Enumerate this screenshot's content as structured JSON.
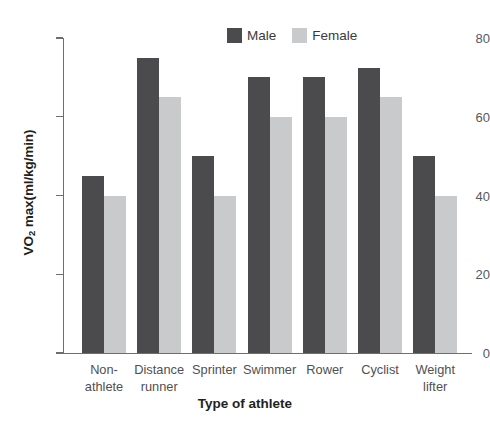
{
  "chart_data": {
    "type": "bar",
    "title": "",
    "xlabel": "Type of athlete",
    "ylabel": "VO2 max(ml/kg/min)",
    "ylabel_prefix": "VO",
    "ylabel_sub": "2",
    "ylabel_suffix": " max(ml/kg/min)",
    "categories": [
      "Non-athlete",
      "Distance runner",
      "Sprinter",
      "Swimmer",
      "Rower",
      "Cyclist",
      "Weight lifter"
    ],
    "category_lines": [
      {
        "line1": "Non-",
        "line2": "athlete"
      },
      {
        "line1": "Distance",
        "line2": "runner"
      },
      {
        "line1": "Sprinter",
        "line2": ""
      },
      {
        "line1": "Swimmer",
        "line2": ""
      },
      {
        "line1": "Rower",
        "line2": ""
      },
      {
        "line1": "Cyclist",
        "line2": ""
      },
      {
        "line1": "Weight",
        "line2": "lifter"
      }
    ],
    "series": [
      {
        "name": "Male",
        "color": "#4b4b4d",
        "values": [
          45,
          75,
          50,
          70,
          70,
          72.5,
          50
        ]
      },
      {
        "name": "Female",
        "color": "#c9cacb",
        "values": [
          40,
          65,
          40,
          60,
          60,
          65,
          40
        ]
      }
    ],
    "ylim": [
      0,
      80
    ],
    "yticks": [
      0,
      20,
      40,
      60,
      80
    ],
    "ytick_labels": [
      "0",
      "20",
      "40",
      "60",
      "80"
    ],
    "grid": false,
    "legend_position": "top-center"
  },
  "legend": {
    "items": [
      {
        "label": "Male"
      },
      {
        "label": "Female"
      }
    ]
  },
  "axis": {
    "x_title": "Type of athlete"
  }
}
